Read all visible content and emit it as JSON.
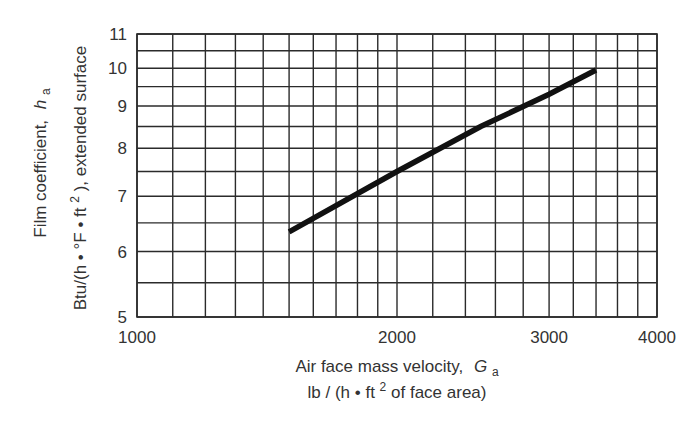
{
  "chart_data": {
    "type": "line",
    "title": "",
    "xscale": "log",
    "yscale": "log",
    "xlim": [
      1000,
      4000
    ],
    "ylim": [
      5,
      11
    ],
    "x_ticks": [
      1000,
      2000,
      3000,
      4000
    ],
    "x_tick_labels": [
      "1000",
      "2000",
      "3000",
      "4000"
    ],
    "y_ticks": [
      5,
      6,
      7,
      8,
      9,
      10,
      11
    ],
    "y_tick_labels": [
      "5",
      "6",
      "7",
      "8",
      "9",
      "10",
      "11"
    ],
    "x_gridlines": [
      1000,
      1100,
      1200,
      1300,
      1400,
      1500,
      1600,
      1700,
      1800,
      1900,
      2000,
      2200,
      2400,
      2600,
      2800,
      3000,
      3200,
      3400,
      3600,
      3800,
      4000
    ],
    "y_gridlines": [
      5,
      5.5,
      6,
      6.5,
      7,
      7.5,
      8,
      8.5,
      9,
      9.5,
      10,
      10.5,
      11
    ],
    "grid": true,
    "legend": null,
    "xlabel": {
      "line1": "Air face mass velocity,",
      "symbol": "G",
      "subscript": "a",
      "line2_prefix": "lb / (h • ft",
      "line2_sup": "2",
      "line2_suffix": " of face area)"
    },
    "ylabel": {
      "line1": "Film coefficient,",
      "symbol": "h",
      "subscript": "a",
      "line2_prefix": "Btu/(h • °F • ft",
      "line2_sup": "2",
      "line2_suffix": "), extended surface"
    },
    "series": [
      {
        "name": "Film coefficient vs air face mass velocity",
        "x": [
          1500,
          2000,
          2500,
          3000,
          3400
        ],
        "y": [
          6.34,
          7.5,
          8.5,
          9.3,
          9.95
        ],
        "color": "#111111"
      }
    ]
  },
  "layout": {
    "plot_left": 137,
    "plot_right": 657,
    "plot_top": 34,
    "plot_bottom": 317
  }
}
